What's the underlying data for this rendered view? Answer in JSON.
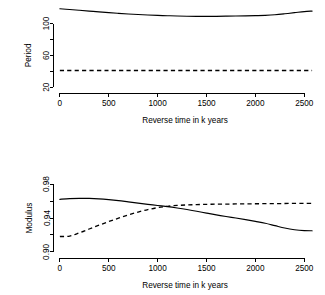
{
  "figure": {
    "background": "#ffffff",
    "foreground": "#000000",
    "panel_count": 2
  },
  "chart_data": [
    {
      "type": "line",
      "title": "",
      "subtitle": "",
      "xlabel": "Reverse time in k years",
      "ylabel": "Period",
      "xlim": [
        -60,
        2620
      ],
      "ylim": [
        14,
        122
      ],
      "xticks": [
        0,
        500,
        1000,
        1500,
        2000,
        2500
      ],
      "xtick_labels": [
        "0",
        "500",
        "1000",
        "1500",
        "2000",
        "2500"
      ],
      "yticks": [
        20,
        40,
        60,
        80,
        100
      ],
      "ytick_labels": [
        "20",
        "",
        "60",
        "",
        "100"
      ],
      "grid": false,
      "legend": "none",
      "series": [
        {
          "name": "period-solid",
          "style": "solid",
          "x": [
            0,
            100,
            200,
            300,
            400,
            500,
            600,
            700,
            800,
            900,
            1000,
            1100,
            1200,
            1300,
            1400,
            1500,
            1600,
            1700,
            1800,
            1900,
            2000,
            2100,
            2200,
            2300,
            2400,
            2500,
            2580
          ],
          "values": [
            118.5,
            117.6,
            116.6,
            115.6,
            114.6,
            113.7,
            112.8,
            112.0,
            111.3,
            110.7,
            110.2,
            109.8,
            109.4,
            109.1,
            108.9,
            108.9,
            109.0,
            109.2,
            109.4,
            109.6,
            109.9,
            110.3,
            111.0,
            112.2,
            113.6,
            115.0,
            115.6
          ]
        },
        {
          "name": "period-dashed",
          "style": "dashed",
          "x": [
            0,
            500,
            1000,
            1500,
            2000,
            2500,
            2580
          ],
          "values": [
            41.0,
            41.0,
            41.0,
            41.0,
            41.0,
            41.0,
            41.0
          ]
        }
      ]
    },
    {
      "type": "line",
      "title": "",
      "subtitle": "",
      "xlabel": "Reverse time in k years",
      "ylabel": "Modulus",
      "xlim": [
        -60,
        2620
      ],
      "ylim": [
        0.894,
        0.986
      ],
      "xticks": [
        0,
        500,
        1000,
        1500,
        2000,
        2500
      ],
      "xtick_labels": [
        "0",
        "500",
        "1000",
        "1500",
        "2000",
        "2500"
      ],
      "yticks": [
        0.9,
        0.92,
        0.94,
        0.96,
        0.98
      ],
      "ytick_labels": [
        "0.90",
        "",
        "0.94",
        "",
        "0.98"
      ],
      "grid": false,
      "legend": "none",
      "series": [
        {
          "name": "modulus-solid",
          "style": "solid",
          "x": [
            0,
            100,
            200,
            300,
            400,
            500,
            600,
            700,
            800,
            900,
            1000,
            1100,
            1200,
            1300,
            1400,
            1500,
            1600,
            1700,
            1800,
            1900,
            2000,
            2100,
            2200,
            2300,
            2400,
            2500,
            2580
          ],
          "values": [
            0.962,
            0.9629,
            0.9632,
            0.9631,
            0.9626,
            0.9617,
            0.9605,
            0.959,
            0.9575,
            0.9561,
            0.9548,
            0.9534,
            0.9518,
            0.95,
            0.948,
            0.9458,
            0.9437,
            0.9418,
            0.94,
            0.9381,
            0.936,
            0.9338,
            0.931,
            0.9282,
            0.9262,
            0.9251,
            0.9249
          ]
        },
        {
          "name": "modulus-dashed",
          "style": "dashed",
          "x": [
            0,
            100,
            200,
            300,
            400,
            500,
            600,
            700,
            800,
            900,
            1000,
            1100,
            1200,
            1300,
            1400,
            1500,
            1600,
            1700,
            1800,
            1900,
            2000,
            2100,
            2200,
            2300,
            2400,
            2500,
            2580
          ],
          "values": [
            0.9182,
            0.9186,
            0.9225,
            0.927,
            0.9315,
            0.9358,
            0.9398,
            0.9436,
            0.947,
            0.9499,
            0.9522,
            0.9538,
            0.9548,
            0.9554,
            0.9558,
            0.9561,
            0.9563,
            0.9564,
            0.9566,
            0.9567,
            0.9568,
            0.9569,
            0.957,
            0.9571,
            0.9572,
            0.9573,
            0.9573
          ]
        }
      ]
    }
  ]
}
